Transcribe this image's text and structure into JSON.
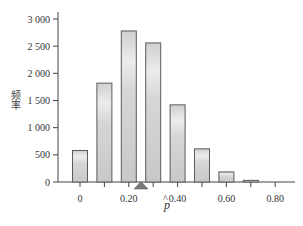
{
  "chart_data": {
    "type": "bar",
    "title": "",
    "xlabel": "p̂",
    "ylabel": "频率",
    "x": [
      0,
      0.1,
      0.2,
      0.3,
      0.4,
      0.5,
      0.6,
      0.7
    ],
    "values": [
      580,
      1820,
      2780,
      2560,
      1420,
      610,
      185,
      30
    ],
    "x_ticks": [
      0,
      0.2,
      0.4,
      0.6,
      0.8
    ],
    "x_tick_labels": [
      "0",
      "0.20",
      "0.40",
      "0.60",
      "0.80"
    ],
    "x_minor_ticks": [
      0,
      0.1,
      0.2,
      0.3,
      0.4,
      0.5,
      0.6,
      0.7,
      0.8
    ],
    "y_ticks": [
      0,
      500,
      1000,
      1500,
      2000,
      2500,
      3000
    ],
    "y_tick_labels": [
      "0",
      "500",
      "1 000",
      "1 500",
      "2 000",
      "2 500",
      "3 000"
    ],
    "ylim": [
      0,
      3000
    ],
    "xlim": [
      -0.1,
      0.88
    ],
    "grid": false,
    "legend": null,
    "marker": {
      "shape": "triangle",
      "x": 0.25,
      "label": "true p"
    },
    "colors": {
      "bar_fill_edge": "#c9c9c9",
      "bar_fill_center": "#ececec",
      "bar_stroke": "#5a5a5a",
      "axis": "#444444",
      "marker": "#777777"
    }
  }
}
